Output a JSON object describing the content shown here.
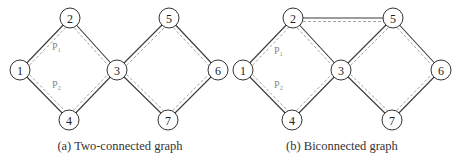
{
  "figures": [
    {
      "id": "a",
      "caption": "(a)  Two-connected graph",
      "caption_x": 120,
      "nodes": [
        {
          "id": "1",
          "x": 20,
          "y": 70
        },
        {
          "id": "2",
          "x": 70,
          "y": 18
        },
        {
          "id": "3",
          "x": 117,
          "y": 70
        },
        {
          "id": "4",
          "x": 69,
          "y": 120
        },
        {
          "id": "5",
          "x": 169,
          "y": 18
        },
        {
          "id": "6",
          "x": 218,
          "y": 70
        },
        {
          "id": "7",
          "x": 168,
          "y": 120
        }
      ],
      "edges": [
        [
          "1",
          "2"
        ],
        [
          "2",
          "3"
        ],
        [
          "1",
          "4"
        ],
        [
          "4",
          "3"
        ],
        [
          "3",
          "5"
        ],
        [
          "5",
          "6"
        ],
        [
          "3",
          "7"
        ],
        [
          "7",
          "6"
        ]
      ],
      "path_labels": [
        {
          "text": "P₁",
          "x": 52,
          "y": 50
        },
        {
          "text": "P₂",
          "x": 52,
          "y": 88
        }
      ]
    },
    {
      "id": "b",
      "caption": "(b)  Biconnected graph",
      "caption_x": 342,
      "nodes": [
        {
          "id": "1",
          "x": 243,
          "y": 70
        },
        {
          "id": "2",
          "x": 293,
          "y": 18
        },
        {
          "id": "3",
          "x": 341,
          "y": 70
        },
        {
          "id": "4",
          "x": 292,
          "y": 120
        },
        {
          "id": "5",
          "x": 393,
          "y": 18
        },
        {
          "id": "6",
          "x": 441,
          "y": 70
        },
        {
          "id": "7",
          "x": 392,
          "y": 120
        }
      ],
      "edges": [
        [
          "1",
          "2"
        ],
        [
          "2",
          "3"
        ],
        [
          "1",
          "4"
        ],
        [
          "4",
          "3"
        ],
        [
          "2",
          "5"
        ],
        [
          "3",
          "5"
        ],
        [
          "5",
          "6"
        ],
        [
          "3",
          "7"
        ],
        [
          "7",
          "6"
        ]
      ],
      "path_labels": [
        {
          "text": "P₁",
          "x": 274,
          "y": 54
        },
        {
          "text": "P₂",
          "x": 274,
          "y": 88
        }
      ]
    }
  ]
}
